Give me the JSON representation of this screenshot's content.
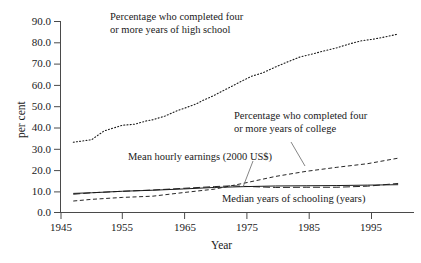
{
  "chart_data": {
    "type": "line",
    "title": "",
    "xlabel": "Year",
    "ylabel": "per cent",
    "xlim": [
      1947,
      2000
    ],
    "ylim": [
      0.0,
      90.0
    ],
    "grid": false,
    "legend_position": "inline-annotations",
    "xticks": [
      "1945",
      "1955",
      "1965",
      "1975",
      "1985",
      "1995"
    ],
    "xtick_values": [
      1945,
      1955,
      1965,
      1975,
      1985,
      1995
    ],
    "yticks": [
      "0.0",
      "10.0",
      "20.0",
      "30.0",
      "40.0",
      "50.0",
      "60.0",
      "70.0",
      "80.0",
      "90.0"
    ],
    "ytick_values": [
      0.0,
      10.0,
      20.0,
      30.0,
      40.0,
      50.0,
      60.0,
      70.0,
      80.0,
      90.0
    ],
    "series": [
      {
        "name": "Percentage who completed four or more years of high school",
        "style": "dotted",
        "color": "#1a1a1a",
        "x": [
          1947,
          1950,
          1952,
          1955,
          1957,
          1959,
          1960,
          1962,
          1964,
          1965,
          1967,
          1968,
          1970,
          1972,
          1974,
          1976,
          1978,
          1980,
          1982,
          1984,
          1986,
          1988,
          1990,
          1992,
          1994,
          1996,
          1998,
          2000
        ],
        "values": [
          33.1,
          34.3,
          38.4,
          41.1,
          41.6,
          43.2,
          43.7,
          45.5,
          48.0,
          49.0,
          51.1,
          52.6,
          55.2,
          58.2,
          61.2,
          64.1,
          65.9,
          68.6,
          71.0,
          73.3,
          74.7,
          76.2,
          77.6,
          79.4,
          80.9,
          81.7,
          82.8,
          84.1
        ]
      },
      {
        "name": "Percentage who completed four or more years of college",
        "style": "dashed",
        "color": "#1a1a1a",
        "x": [
          1947,
          1950,
          1955,
          1960,
          1965,
          1970,
          1975,
          1980,
          1985,
          1990,
          1995,
          2000
        ],
        "values": [
          5.4,
          6.2,
          7.1,
          7.7,
          9.4,
          11.0,
          13.9,
          17.0,
          19.4,
          21.3,
          23.0,
          25.6
        ]
      },
      {
        "name": "Mean hourly earnings (2000 US$)",
        "style": "long-dash",
        "color": "#1a1a1a",
        "x": [
          1947,
          1950,
          1955,
          1960,
          1965,
          1970,
          1973,
          1975,
          1980,
          1985,
          1990,
          1995,
          2000
        ],
        "values": [
          8.6,
          9.3,
          10.0,
          10.6,
          11.4,
          12.2,
          12.6,
          12.3,
          11.8,
          11.9,
          11.9,
          12.4,
          13.7
        ]
      },
      {
        "name": "Median years of schooling (years)",
        "style": "solid",
        "color": "#1a1a1a",
        "x": [
          1947,
          1950,
          1955,
          1960,
          1965,
          1970,
          1975,
          1980,
          1985,
          1990,
          1995,
          2000
        ],
        "values": [
          9.0,
          9.3,
          10.0,
          10.5,
          11.1,
          11.8,
          12.2,
          12.5,
          12.6,
          12.7,
          12.9,
          13.1
        ]
      }
    ],
    "annotations": [
      {
        "id": "annot-high-school",
        "line1": "Percentage who completed four",
        "line2": "or more years of high school",
        "leader": false
      },
      {
        "id": "annot-college",
        "line1": "Percentage who completed four",
        "line2": "or more years of college",
        "leader": true
      },
      {
        "id": "annot-earnings",
        "line1": "Mean hourly earnings (2000 US$)",
        "line2": "",
        "leader": true
      },
      {
        "id": "annot-schooling",
        "line1": "Median years of schooling (years)",
        "line2": "",
        "leader": false
      }
    ]
  }
}
